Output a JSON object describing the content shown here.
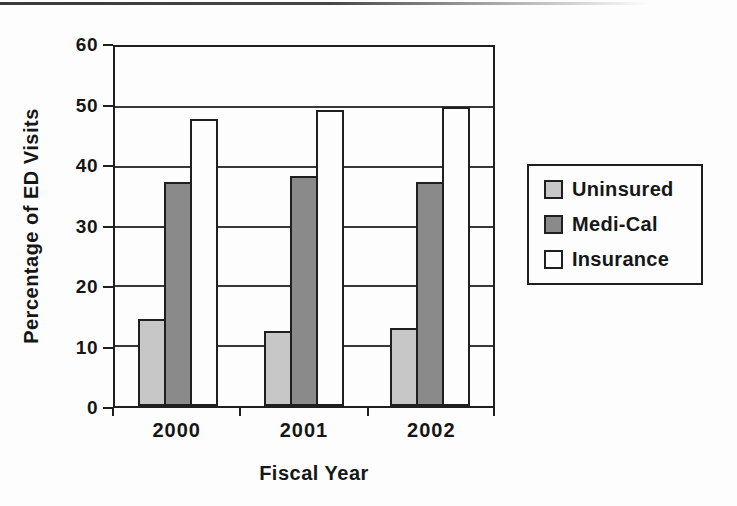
{
  "chart_data": {
    "type": "bar",
    "title": "",
    "categories": [
      "2000",
      "2001",
      "2002"
    ],
    "series": [
      {
        "name": "Uninsured",
        "color": "#c7c7c7",
        "values": [
          14.5,
          12.5,
          13
        ]
      },
      {
        "name": "Medi-Cal",
        "color": "#8a8a8a",
        "values": [
          37.5,
          38.5,
          37.5
        ]
      },
      {
        "name": "Insurance",
        "color": "#fdfdfd",
        "values": [
          48,
          49.5,
          50
        ]
      }
    ],
    "xlabel": "Fiscal Year",
    "ylabel": "Percentage of ED Visits",
    "ylim": [
      0,
      60
    ],
    "yticks": [
      0,
      10,
      20,
      30,
      40,
      50,
      60
    ],
    "grid": true,
    "legend_position": "right",
    "line_color": "#1f1f1f"
  }
}
